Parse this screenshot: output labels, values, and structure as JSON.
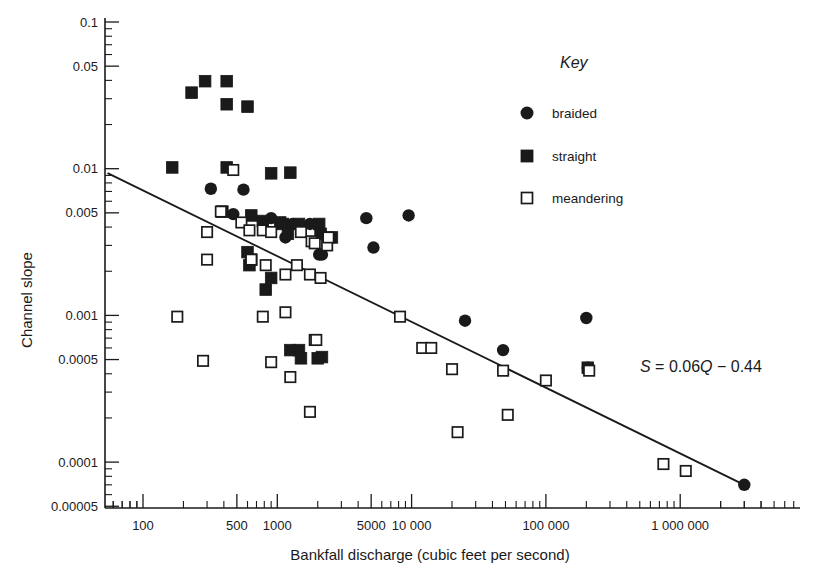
{
  "chart_data": {
    "type": "scatter",
    "title": "",
    "xlabel": "Bankfall discharge (cubic feet per second)",
    "ylabel": "Channel slope",
    "xscale": "log",
    "yscale": "log",
    "xlim": [
      50,
      4000000
    ],
    "ylim": [
      5e-05,
      0.1
    ],
    "grid": false,
    "xticklabels": [
      "100",
      "500",
      "1000",
      "5000",
      "10 000",
      "100 000",
      "1 000 000"
    ],
    "xtickvalues": [
      100,
      500,
      1000,
      5000,
      10000,
      100000,
      1000000
    ],
    "yticklabels": [
      "0.1",
      "0.05",
      "0.01",
      "0.005",
      "0.001",
      "0.0005",
      "0.0001",
      "0.00005"
    ],
    "ytickvalues": [
      0.1,
      0.05,
      0.01,
      0.005,
      0.001,
      0.0005,
      0.0001,
      5e-05
    ],
    "legend_title": "Key",
    "legend_position": "top-right",
    "series": [
      {
        "name": "braided",
        "marker": "filled-circle",
        "color": "#1a1a1a",
        "points": [
          [
            320,
            0.0073
          ],
          [
            560,
            0.0072
          ],
          [
            470,
            0.0049
          ],
          [
            900,
            0.0046
          ],
          [
            1150,
            0.0034
          ],
          [
            1300,
            0.0042
          ],
          [
            1750,
            0.0042
          ],
          [
            2050,
            0.0026
          ],
          [
            2150,
            0.0026
          ],
          [
            4600,
            0.0046
          ],
          [
            9500,
            0.0048
          ],
          [
            5200,
            0.0029
          ],
          [
            25000,
            0.00092
          ],
          [
            48000,
            0.00058
          ],
          [
            200000,
            0.00096
          ],
          [
            205000,
            0.00044
          ],
          [
            3000000,
            7e-05
          ]
        ]
      },
      {
        "name": "straight",
        "marker": "filled-square",
        "color": "#1a1a1a",
        "points": [
          [
            230,
            0.033
          ],
          [
            290,
            0.0395
          ],
          [
            420,
            0.0395
          ],
          [
            420,
            0.0275
          ],
          [
            600,
            0.0265
          ],
          [
            165,
            0.0102
          ],
          [
            420,
            0.0102
          ],
          [
            900,
            0.0093
          ],
          [
            1250,
            0.0094
          ],
          [
            390,
            0.0051
          ],
          [
            640,
            0.0048
          ],
          [
            780,
            0.0044
          ],
          [
            1050,
            0.0043
          ],
          [
            1100,
            0.0042
          ],
          [
            1450,
            0.0042
          ],
          [
            2050,
            0.0042
          ],
          [
            1200,
            0.0036
          ],
          [
            600,
            0.0027
          ],
          [
            640,
            0.0024
          ],
          [
            620,
            0.0022
          ],
          [
            2100,
            0.0036
          ],
          [
            2550,
            0.0034
          ],
          [
            900,
            0.0018
          ],
          [
            820,
            0.0015
          ],
          [
            1250,
            0.00058
          ],
          [
            1450,
            0.00058
          ],
          [
            1500,
            0.00051
          ],
          [
            2150,
            0.00052
          ],
          [
            2000,
            0.00051
          ],
          [
            205000,
            0.00044
          ]
        ]
      },
      {
        "name": "meandering",
        "marker": "open-square",
        "color": "#ffffff",
        "points": [
          [
            470,
            0.0098
          ],
          [
            380,
            0.0051
          ],
          [
            300,
            0.0037
          ],
          [
            540,
            0.0043
          ],
          [
            620,
            0.0038
          ],
          [
            780,
            0.0038
          ],
          [
            900,
            0.0037
          ],
          [
            1500,
            0.0037
          ],
          [
            1800,
            0.0032
          ],
          [
            1900,
            0.0031
          ],
          [
            2350,
            0.003
          ],
          [
            2400,
            0.0034
          ],
          [
            300,
            0.0024
          ],
          [
            640,
            0.0024
          ],
          [
            820,
            0.0022
          ],
          [
            1150,
            0.0019
          ],
          [
            1400,
            0.0022
          ],
          [
            1750,
            0.0019
          ],
          [
            2100,
            0.0018
          ],
          [
            180,
            0.00098
          ],
          [
            780,
            0.00098
          ],
          [
            1150,
            0.00105
          ],
          [
            8200,
            0.00098
          ],
          [
            280,
            0.00049
          ],
          [
            900,
            0.00048
          ],
          [
            1900,
            0.00068
          ],
          [
            1950,
            0.00068
          ],
          [
            12000,
            0.0006
          ],
          [
            14000,
            0.0006
          ],
          [
            20000,
            0.00043
          ],
          [
            48000,
            0.00042
          ],
          [
            100000,
            0.00036
          ],
          [
            210000,
            0.00042
          ],
          [
            1250,
            0.00038
          ],
          [
            1750,
            0.00022
          ],
          [
            22000,
            0.00016
          ],
          [
            52000,
            0.00021
          ],
          [
            750000,
            9.7e-05
          ],
          [
            1100000,
            8.7e-05
          ]
        ]
      }
    ],
    "fit_line": {
      "label": "S = 0.06Q − 0.44",
      "label_parts": {
        "s": "S",
        "eq": " = 0.06",
        "q": "Q",
        "rest": " − 0.44"
      },
      "x_start": 55,
      "y_start": 0.0093,
      "x_end": 3000000,
      "y_end": 7e-05
    }
  },
  "legend": {
    "title": "Key",
    "entries": [
      {
        "label": "braided",
        "marker": "filled-circle"
      },
      {
        "label": "straight",
        "marker": "filled-square"
      },
      {
        "label": "meandering",
        "marker": "open-square"
      }
    ]
  },
  "axes": {
    "y_label": "Channel slope",
    "x_label": "Bankfall discharge (cubic feet per second)",
    "y_ticks": [
      "0.1",
      "0.05",
      "0.01",
      "0.005",
      "0.001",
      "0.0005",
      "0.0001",
      "0.00005"
    ],
    "x_ticks": [
      "100",
      "500",
      "1000",
      "5000",
      "10 000",
      "100 000",
      "1 000 000"
    ]
  },
  "annotation": {
    "equation": "S = 0.06Q − 0.44"
  },
  "colors": {
    "ink": "#1a1a1a",
    "paper": "#ffffff"
  }
}
